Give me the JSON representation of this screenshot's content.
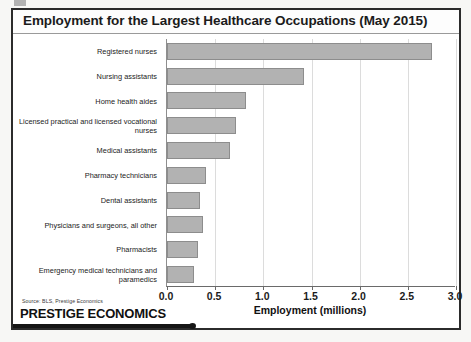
{
  "slide": {
    "title": "Employment for the Largest Healthcare Occupations (May 2015)",
    "source_note": "Source: BLS, Prestige Economics",
    "brand": "PRESTIGE ECONOMICS"
  },
  "colors": {
    "bar_fill": "#b2b2b2",
    "bar_border": "#8d8d8d",
    "gridline": "#dcdcdc",
    "axis": "#6a6a6a",
    "frame": "#2b2b2b",
    "text": "#1b1b1b"
  },
  "chart_data": {
    "type": "bar",
    "orientation": "horizontal",
    "title": "Employment for the Largest Healthcare Occupations (May 2015)",
    "xlabel": "Employment (millions)",
    "ylabel": "",
    "xlim": [
      0.0,
      3.0
    ],
    "xticks": [
      "0.0",
      "0.5",
      "1.0",
      "1.5",
      "2.0",
      "2.5",
      "3.0"
    ],
    "xtick_values": [
      0.0,
      0.5,
      1.0,
      1.5,
      2.0,
      2.5,
      3.0
    ],
    "grid": "vertical",
    "legend": "none",
    "categories": [
      "Registered nurses",
      "Nursing assistants",
      "Home health aides",
      "Licensed practical and licensed vocational nurses",
      "Medical assistants",
      "Pharmacy technicians",
      "Dental assistants",
      "Physicians and surgeons, all other",
      "Pharmacists",
      "Emergency medical technicians and paramedics"
    ],
    "values": [
      2.75,
      1.42,
      0.82,
      0.72,
      0.65,
      0.41,
      0.34,
      0.37,
      0.32,
      0.28
    ],
    "units": "millions of jobs"
  }
}
